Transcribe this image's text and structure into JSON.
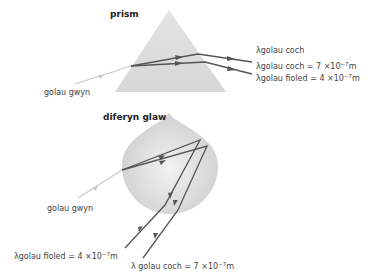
{
  "prism": {
    "title": "prism",
    "input_label": "golau gwyn",
    "output_labels": [
      {
        "lambda": "λ",
        "text": "golau coch"
      },
      {
        "lambda": "λ",
        "text": "golau coch = 7 ×10",
        "exp": "−7",
        "unit": "m"
      },
      {
        "lambda": "λ",
        "text": "golau fioled = 4 ×10",
        "exp": "−7",
        "unit": "m"
      }
    ]
  },
  "raindrop": {
    "title": "diferyn glaw",
    "input_label": "golau gwyn",
    "output_labels": [
      {
        "lambda": "λ",
        "text": "golau fioled = 4  ×10",
        "exp": "−7",
        "unit": "m"
      },
      {
        "lambda": "λ",
        "text": "golau coch = 7 ×10",
        "exp": "−7",
        "unit": "m"
      }
    ]
  },
  "colors": {
    "shape_fill": "#d9d9d9",
    "ray_dark": "#555555",
    "ray_white": "#c8c8c8"
  }
}
